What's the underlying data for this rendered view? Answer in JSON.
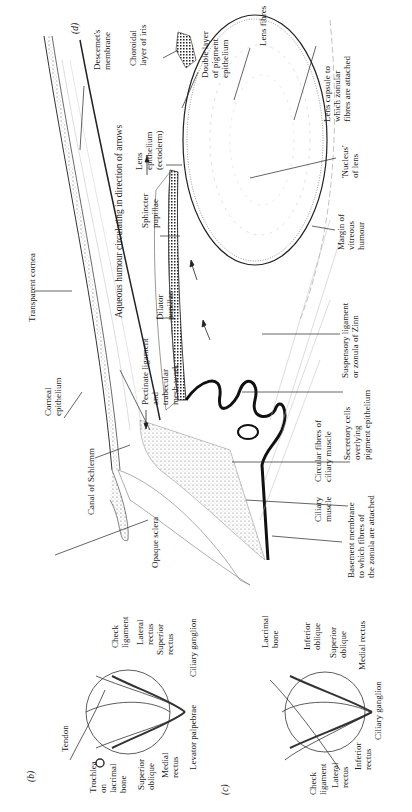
{
  "figure": {
    "panels": [
      {
        "id": "b",
        "label": "(b)"
      },
      {
        "id": "c",
        "label": "(c)"
      },
      {
        "id": "d",
        "label": "(d)"
      }
    ]
  },
  "panel_d": {
    "label": "(d)",
    "labels": {
      "descemets_membrane": "Descemet's\nmembrane",
      "aqueous_humour": "Aqueous humour circulating in direction of arrows",
      "transparent_cornea": "Transparent cornea",
      "corneal_epithelium": "Corneal\nepithelium",
      "canal_of_schlemm": "Canal of Schlemm",
      "opaque_sclera": "Opaque sclera",
      "pectinate_ligament": "Pectinate ligament\nand\ntrabecular\nmesh-work",
      "dilator_pupillae": "Dilator\npupillae",
      "sphincter_pupillae": "Sphincter\npupillae",
      "lens_epithelium": "Lens\nepithelium\n(ectoderm)",
      "choroidal_layer": "Choroidal\nlayer of iris",
      "double_layer": "Double layer\nof pigment\nepithelium",
      "lens_fibres": "Lens fibres",
      "lens_capsule": "Lens capsule to\nwhich zonular\nfibres are attached",
      "nucleus_of_lens": "'Nucleus'\nof lens",
      "margin_vitreous": "Margin of\nvitreous\nhumour",
      "suspensory_ligament": "Suspensory ligament\nor zonula of Zinn",
      "secretory_cells": "Secretory cells\noverlying\npigment epithelium",
      "circular_fibres": "Circular fibres of\nciliary muscle",
      "ciliary_muscle": "Ciliary\nmuscle",
      "basement_membrane": "Basement membrane\nto which fibres of\nthe zonula are attached"
    }
  },
  "panel_b": {
    "label": "(b)",
    "labels": {
      "trochlea": "Trochlea\non\nlacrimal\nbone",
      "tendon": "Tendon",
      "check_ligament": "Check\nligament",
      "lateral_rectus": "Lateral\nrectus",
      "superior_rectus": "Superior\nrectus",
      "ciliary_ganglion": "Ciliary ganglion",
      "superior_oblique": "Superior\noblique",
      "medial_rectus": "Medial\nrectus",
      "levator_palpebrae": "Levator palpebrae"
    }
  },
  "panel_c": {
    "label": "(c)",
    "labels": {
      "lacrimal_bone": "Lacrimal\nbone",
      "inferior_oblique": "Inferior\noblique",
      "superior_oblique": "Superior\noblique",
      "medial_rectus": "Medial rectus",
      "ciliary_ganglion": "Ciliary ganglion",
      "inferior_rectus": "Inferior\nrectus",
      "lateral_rectus": "Lateral\nrectus",
      "check_ligament": "Check\nligament"
    }
  }
}
